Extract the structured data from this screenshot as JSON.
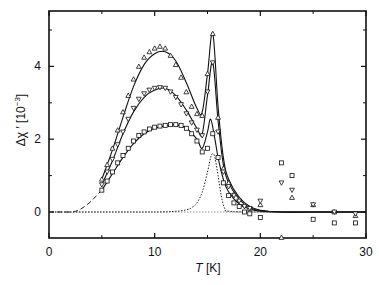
{
  "chart_data": {
    "type": "scatter",
    "title": "",
    "xlabel": "T [K]",
    "xlabel_italic": "T",
    "xlabel_unit": " [K]",
    "ylabel": "Δχ' [10^-3]",
    "ylabel_main": "Δχ ′ [10",
    "ylabel_exp": "−3",
    "ylabel_close": "]",
    "xlim": [
      0,
      30
    ],
    "ylim": [
      -0.7,
      5.5
    ],
    "xticks": [
      0,
      10,
      20,
      30
    ],
    "xtick_labels": [
      "0",
      "10",
      "20",
      "30"
    ],
    "xminor": [
      5,
      15,
      25
    ],
    "yticks": [
      0,
      2,
      4
    ],
    "ytick_labels": [
      "0",
      "2",
      "4"
    ],
    "yminor": [
      1,
      3,
      5
    ],
    "grid": false,
    "legend": null,
    "series": [
      {
        "name": "upward triangles (fit: solid line)",
        "marker": "triangle-up",
        "x": [
          5.0,
          5.5,
          6.0,
          6.5,
          7.0,
          7.5,
          8.0,
          8.5,
          9.0,
          9.5,
          10.0,
          10.5,
          11.0,
          11.5,
          12.0,
          12.5,
          13.0,
          13.5,
          14.0,
          14.5,
          15.0,
          15.5,
          16.0,
          16.5,
          17.0,
          17.5,
          18.0,
          18.5,
          19.0,
          20.0,
          22.0,
          23.0,
          25.0,
          27.0,
          29.0
        ],
        "values": [
          0.9,
          1.3,
          1.75,
          2.25,
          2.75,
          3.2,
          3.65,
          4.0,
          4.25,
          4.4,
          4.5,
          4.55,
          4.5,
          4.3,
          4.05,
          3.7,
          3.3,
          2.9,
          2.7,
          2.65,
          3.8,
          4.9,
          2.6,
          1.2,
          0.8,
          0.5,
          0.35,
          0.2,
          0.1,
          0.2,
          -0.7,
          0.4,
          0.2,
          0.0,
          -0.1
        ]
      },
      {
        "name": "downward triangles (fit: solid line)",
        "marker": "triangle-down",
        "x": [
          5.0,
          5.5,
          6.0,
          6.5,
          7.0,
          7.5,
          8.0,
          8.5,
          9.0,
          9.5,
          10.0,
          10.5,
          11.0,
          11.5,
          12.0,
          12.5,
          13.0,
          13.5,
          14.0,
          14.5,
          15.0,
          15.5,
          16.0,
          16.5,
          17.0,
          17.5,
          18.0,
          18.5,
          19.0,
          20.0,
          22.0,
          23.0,
          25.0,
          27.0,
          29.0
        ],
        "values": [
          0.75,
          1.1,
          1.45,
          1.85,
          2.2,
          2.55,
          2.85,
          3.1,
          3.25,
          3.35,
          3.4,
          3.42,
          3.4,
          3.3,
          3.15,
          2.95,
          2.7,
          2.45,
          2.25,
          2.1,
          3.3,
          4.1,
          2.2,
          1.1,
          0.7,
          0.45,
          0.3,
          0.15,
          0.1,
          0.3,
          0.8,
          0.6,
          0.2,
          0.0,
          -0.05
        ]
      },
      {
        "name": "squares (fit: solid line, extrapolated dashed)",
        "marker": "square",
        "x": [
          5.0,
          5.5,
          6.0,
          6.5,
          7.0,
          7.5,
          8.0,
          8.5,
          9.0,
          9.5,
          10.0,
          10.5,
          11.0,
          11.5,
          12.0,
          12.5,
          13.0,
          13.5,
          14.0,
          14.5,
          15.0,
          15.5,
          16.0,
          16.5,
          17.0,
          17.5,
          18.0,
          18.5,
          19.0,
          20.0,
          22.0,
          23.0,
          25.0,
          27.0,
          29.0
        ],
        "values": [
          0.6,
          0.85,
          1.1,
          1.35,
          1.55,
          1.75,
          1.95,
          2.1,
          2.2,
          2.28,
          2.33,
          2.36,
          2.38,
          2.4,
          2.4,
          2.38,
          2.3,
          2.15,
          1.95,
          1.65,
          1.75,
          2.15,
          1.5,
          0.8,
          0.45,
          0.25,
          0.15,
          0.0,
          -0.05,
          -0.15,
          1.35,
          1.0,
          -0.2,
          -0.3,
          -0.3
        ]
      },
      {
        "name": "dashed line (extrapolation of square curve)",
        "marker": "none",
        "linestyle": "dashed",
        "x": [
          0,
          1,
          2,
          2.5,
          3,
          3.5,
          4,
          4.5,
          5
        ],
        "values": [
          0,
          0,
          0,
          0.02,
          0.08,
          0.18,
          0.3,
          0.45,
          0.6
        ]
      },
      {
        "name": "dotted line (sharp peak component)",
        "marker": "none",
        "linestyle": "dotted",
        "x": [
          0,
          5,
          10,
          12,
          13,
          13.5,
          14,
          14.5,
          15.0,
          15.3,
          15.5,
          15.7,
          16.0,
          16.3,
          16.6,
          17,
          20,
          30
        ],
        "values": [
          0,
          0,
          0,
          0.02,
          0.06,
          0.12,
          0.25,
          0.55,
          1.1,
          1.5,
          1.6,
          1.5,
          1.0,
          0.45,
          0.12,
          0.02,
          0,
          0
        ]
      }
    ],
    "fit_curves": [
      {
        "name": "upper solid fit",
        "x": [
          5,
          6,
          7,
          8,
          9,
          10,
          11,
          12,
          13,
          14,
          14.5,
          15,
          15.5,
          16,
          16.5,
          17,
          18,
          19,
          20,
          22,
          25,
          30
        ],
        "values": [
          0.9,
          1.7,
          2.6,
          3.45,
          4.05,
          4.35,
          4.4,
          4.15,
          3.55,
          2.85,
          2.75,
          3.8,
          4.9,
          2.9,
          1.5,
          0.9,
          0.4,
          0.15,
          0.05,
          0,
          0,
          0
        ]
      },
      {
        "name": "middle solid fit",
        "x": [
          5,
          6,
          7,
          8,
          9,
          10,
          11,
          12,
          13,
          14,
          14.5,
          15,
          15.5,
          16,
          16.5,
          17,
          18,
          19,
          20,
          22,
          25,
          30
        ],
        "values": [
          0.75,
          1.4,
          2.15,
          2.75,
          3.15,
          3.35,
          3.4,
          3.2,
          2.8,
          2.3,
          2.15,
          3.2,
          4.1,
          2.5,
          1.3,
          0.8,
          0.35,
          0.12,
          0.04,
          0,
          0,
          0
        ]
      },
      {
        "name": "lower solid fit",
        "x": [
          5,
          6,
          7,
          8,
          9,
          10,
          11,
          12,
          13,
          14,
          14.5,
          15,
          15.3,
          15.7,
          16,
          16.5,
          17,
          18,
          19,
          20,
          22,
          25,
          30
        ],
        "values": [
          0.6,
          1.05,
          1.5,
          1.88,
          2.15,
          2.3,
          2.37,
          2.4,
          2.3,
          2.0,
          1.75,
          2.2,
          2.55,
          2.0,
          1.5,
          0.9,
          0.55,
          0.22,
          0.08,
          0.02,
          0,
          0,
          0
        ]
      }
    ]
  }
}
